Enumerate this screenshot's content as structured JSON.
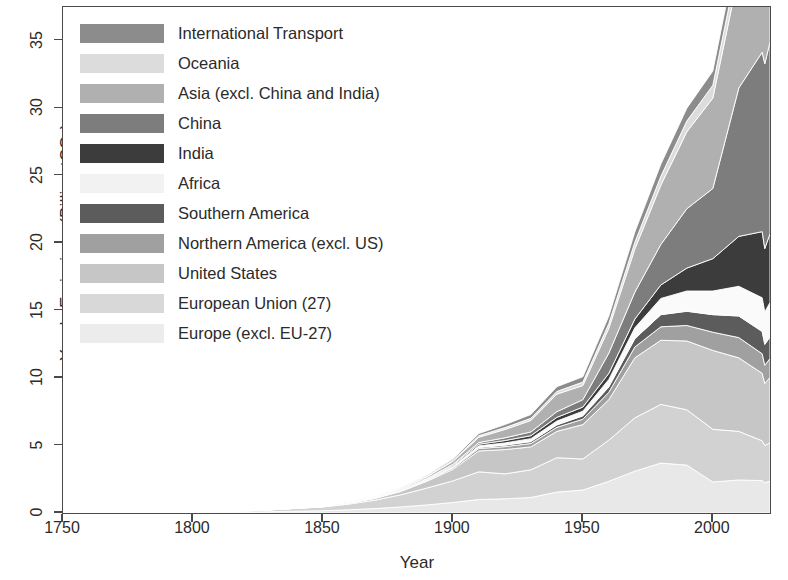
{
  "chart_data": {
    "type": "area",
    "stacked": true,
    "title": "",
    "xlabel": "Year",
    "ylabel": "Yearly Emissions (Billion tCO2)",
    "ylabel_display": "Yearly Emissions (Billion tCO₂)",
    "xlim": [
      1750,
      2022
    ],
    "ylim": [
      0,
      37.5
    ],
    "xticks": [
      1750,
      1800,
      1850,
      1900,
      1950,
      2000
    ],
    "yticks": [
      0,
      5,
      10,
      15,
      20,
      25,
      30,
      35
    ],
    "grid": false,
    "legend_position": "top-left-inside",
    "x": [
      1750,
      1775,
      1800,
      1825,
      1850,
      1860,
      1870,
      1880,
      1890,
      1900,
      1910,
      1920,
      1930,
      1940,
      1950,
      1960,
      1970,
      1980,
      1990,
      2000,
      2010,
      2019,
      2020,
      2022
    ],
    "series": [
      {
        "name": "Europe (excl. EU-27)",
        "color": "#e8e8e8",
        "stack_order": 1,
        "values": [
          0.0,
          0.01,
          0.03,
          0.08,
          0.17,
          0.24,
          0.33,
          0.45,
          0.6,
          0.78,
          1.0,
          1.05,
          1.15,
          1.55,
          1.7,
          2.35,
          3.1,
          3.7,
          3.55,
          2.3,
          2.45,
          2.4,
          2.25,
          2.35
        ]
      },
      {
        "name": "European Union (27)",
        "color": "#d2d2d2",
        "stack_order": 2,
        "values": [
          0.0,
          0.01,
          0.04,
          0.1,
          0.28,
          0.42,
          0.62,
          0.9,
          1.25,
          1.6,
          2.05,
          1.85,
          2.05,
          2.55,
          2.3,
          3.05,
          3.95,
          4.35,
          4.1,
          3.9,
          3.6,
          2.95,
          2.75,
          2.85
        ]
      },
      {
        "name": "United States",
        "color": "#c6c6c6",
        "stack_order": 3,
        "values": [
          0.0,
          0.0,
          0.0,
          0.01,
          0.02,
          0.07,
          0.13,
          0.25,
          0.5,
          0.85,
          1.55,
          1.8,
          1.7,
          1.95,
          2.55,
          3.0,
          4.45,
          4.75,
          5.1,
          5.85,
          5.45,
          5.0,
          4.6,
          4.85
        ]
      },
      {
        "name": "Northern America (excl. US)",
        "color": "#a0a0a0",
        "stack_order": 4,
        "values": [
          0.0,
          0.0,
          0.0,
          0.0,
          0.0,
          0.01,
          0.02,
          0.03,
          0.06,
          0.1,
          0.18,
          0.22,
          0.25,
          0.3,
          0.4,
          0.55,
          0.8,
          1.0,
          1.15,
          1.35,
          1.5,
          1.45,
          1.35,
          1.4
        ]
      },
      {
        "name": "Southern America",
        "color": "#5c5c5c",
        "stack_order": 5,
        "values": [
          0.0,
          0.0,
          0.0,
          0.0,
          0.0,
          0.0,
          0.01,
          0.02,
          0.03,
          0.05,
          0.08,
          0.11,
          0.14,
          0.18,
          0.25,
          0.4,
          0.62,
          0.9,
          1.05,
          1.3,
          1.6,
          1.65,
          1.55,
          1.6
        ]
      },
      {
        "name": "Africa",
        "color": "#fafafa",
        "stack_order": 6,
        "values": [
          0.0,
          0.0,
          0.0,
          0.0,
          0.0,
          0.0,
          0.01,
          0.02,
          0.04,
          0.07,
          0.12,
          0.16,
          0.22,
          0.28,
          0.35,
          0.55,
          0.8,
          1.2,
          1.5,
          1.75,
          2.2,
          2.5,
          2.4,
          2.55
        ]
      },
      {
        "name": "India",
        "color": "#3c3c3c",
        "stack_order": 7,
        "values": [
          0.0,
          0.0,
          0.0,
          0.0,
          0.0,
          0.0,
          0.01,
          0.02,
          0.04,
          0.08,
          0.12,
          0.18,
          0.22,
          0.28,
          0.3,
          0.45,
          0.65,
          1.0,
          1.7,
          2.4,
          3.7,
          4.9,
          4.7,
          5.1
        ]
      },
      {
        "name": "China",
        "color": "#7d7d7d",
        "stack_order": 8,
        "values": [
          0.0,
          0.0,
          0.0,
          0.0,
          0.0,
          0.01,
          0.01,
          0.02,
          0.04,
          0.08,
          0.12,
          0.2,
          0.28,
          0.42,
          0.55,
          1.5,
          2.0,
          3.0,
          4.4,
          5.2,
          11.0,
          13.3,
          13.7,
          14.2
        ]
      },
      {
        "name": "Asia (excl. China and India)",
        "color": "#b0b0b0",
        "stack_order": 9,
        "values": [
          0.0,
          0.0,
          0.0,
          0.0,
          0.01,
          0.02,
          0.04,
          0.07,
          0.12,
          0.22,
          0.4,
          0.62,
          0.85,
          1.3,
          1.05,
          1.85,
          3.2,
          4.4,
          5.7,
          6.7,
          8.5,
          9.4,
          9.0,
          9.5
        ]
      },
      {
        "name": "Oceania",
        "color": "#dcdcdc",
        "stack_order": 10,
        "values": [
          0.0,
          0.0,
          0.0,
          0.0,
          0.01,
          0.01,
          0.02,
          0.03,
          0.05,
          0.07,
          0.11,
          0.14,
          0.16,
          0.2,
          0.25,
          0.35,
          0.5,
          0.65,
          0.8,
          0.95,
          1.1,
          1.1,
          1.05,
          1.1
        ]
      },
      {
        "name": "International Transport",
        "color": "#8c8c8c",
        "stack_order": 11,
        "values": [
          0.0,
          0.0,
          0.0,
          0.0,
          0.0,
          0.01,
          0.02,
          0.04,
          0.06,
          0.1,
          0.16,
          0.22,
          0.28,
          0.35,
          0.4,
          0.55,
          0.75,
          0.9,
          0.95,
          1.05,
          1.25,
          1.3,
          0.95,
          1.15
        ]
      }
    ],
    "totals": [
      0.0,
      0.02,
      0.07,
      0.19,
      0.49,
      0.79,
      1.22,
      1.85,
      2.79,
      4.0,
      5.89,
      6.55,
      7.3,
      9.36,
      10.1,
      14.6,
      20.82,
      25.85,
      30.0,
      32.75,
      42.35,
      45.95,
      44.3,
      46.65
    ]
  },
  "axes": {
    "ylabel_prefix": "Yearly Emissions (Billion tCO",
    "ylabel_sub": "2",
    "ylabel_suffix": ")",
    "xlabel": "Year",
    "xticks": [
      "1750",
      "1800",
      "1850",
      "1900",
      "1950",
      "2000"
    ],
    "yticks": [
      "0",
      "5",
      "10",
      "15",
      "20",
      "25",
      "30",
      "35"
    ]
  },
  "legend": {
    "items": [
      {
        "label": "International Transport",
        "color": "#8c8c8c"
      },
      {
        "label": "Oceania",
        "color": "#dcdcdc"
      },
      {
        "label": "Asia (excl. China and India)",
        "color": "#b0b0b0"
      },
      {
        "label": "China",
        "color": "#7d7d7d"
      },
      {
        "label": "India",
        "color": "#3c3c3c"
      },
      {
        "label": "Africa",
        "color": "#f2f2f2"
      },
      {
        "label": "Southern America",
        "color": "#5c5c5c"
      },
      {
        "label": "Northern America (excl. US)",
        "color": "#a0a0a0"
      },
      {
        "label": "United States",
        "color": "#c6c6c6"
      },
      {
        "label": "European Union (27)",
        "color": "#d8d8d8"
      },
      {
        "label": "Europe (excl. EU-27)",
        "color": "#ececec"
      }
    ]
  }
}
